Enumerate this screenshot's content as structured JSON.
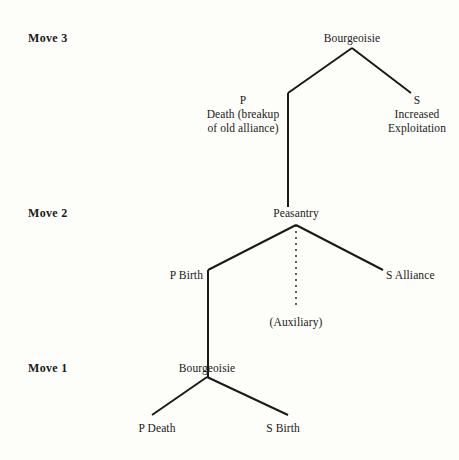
{
  "diagram": {
    "background_color": "#fdfdfa",
    "ink_color": "#1a1a18",
    "move_labels": [
      {
        "id": "move-3",
        "text": "Move 3",
        "x": 28,
        "y": 31
      },
      {
        "id": "move-2",
        "text": "Move 2",
        "x": 28,
        "y": 206
      },
      {
        "id": "move-1",
        "text": "Move 1",
        "x": 28,
        "y": 361
      }
    ],
    "nodes": [
      {
        "id": "move3-root",
        "text": "Bourgeoisie",
        "x": 352,
        "y": 31,
        "align": "center"
      },
      {
        "id": "move3-left-line1",
        "text": "P",
        "x": 243,
        "y": 93,
        "align": "center"
      },
      {
        "id": "move3-left-line2",
        "text": "Death (breakup",
        "x": 243,
        "y": 107,
        "align": "center"
      },
      {
        "id": "move3-left-line3",
        "text": "of old alliance)",
        "x": 243,
        "y": 121,
        "align": "center"
      },
      {
        "id": "move3-right-line1",
        "text": "S",
        "x": 417,
        "y": 93,
        "align": "center"
      },
      {
        "id": "move3-right-line2",
        "text": "Increased",
        "x": 417,
        "y": 107,
        "align": "center"
      },
      {
        "id": "move3-right-line3",
        "text": "Exploitation",
        "x": 417,
        "y": 121,
        "align": "center"
      },
      {
        "id": "move2-root",
        "text": "Peasantry",
        "x": 296,
        "y": 206,
        "align": "center"
      },
      {
        "id": "move2-left",
        "text": "P Birth",
        "x": 203,
        "y": 268,
        "align": "right"
      },
      {
        "id": "move2-right",
        "text": "S Alliance",
        "x": 386,
        "y": 268,
        "align": "left"
      },
      {
        "id": "move2-aux",
        "text": "(Auxiliary)",
        "x": 296,
        "y": 315,
        "align": "center"
      },
      {
        "id": "move1-root",
        "text": "Bourgeoisie",
        "x": 207,
        "y": 361,
        "align": "center"
      },
      {
        "id": "move1-left",
        "text": "P Death",
        "x": 157,
        "y": 421,
        "align": "center"
      },
      {
        "id": "move1-right",
        "text": "S Birth",
        "x": 283,
        "y": 421,
        "align": "center"
      }
    ],
    "edges": [
      {
        "id": "edge-move3-root-to-left",
        "from": "move3-root",
        "to": "move3-left",
        "style": "solid",
        "points": "352,48 288,93"
      },
      {
        "id": "edge-move3-root-to-right",
        "from": "move3-root",
        "to": "move3-right",
        "style": "solid",
        "points": "352,48 411,93"
      },
      {
        "id": "edge-move3-left-to-move2",
        "from": "move3-left",
        "to": "move2-root",
        "style": "solid",
        "points": "288,93 288,207"
      },
      {
        "id": "edge-move2-root-to-left",
        "from": "move2-root",
        "to": "move2-left",
        "style": "solid",
        "points": "296,225 208,270"
      },
      {
        "id": "edge-move2-root-to-right",
        "from": "move2-root",
        "to": "move2-right",
        "style": "solid",
        "points": "296,225 383,270"
      },
      {
        "id": "edge-move2-root-to-aux",
        "from": "move2-root",
        "to": "move2-aux",
        "style": "dashed",
        "points": "296,225 296,305"
      },
      {
        "id": "edge-move2-left-to-move1",
        "from": "move2-left",
        "to": "move1-root",
        "style": "solid",
        "points": "208,270 208,377"
      },
      {
        "id": "edge-move1-root-to-left",
        "from": "move1-root",
        "to": "move1-left",
        "style": "solid",
        "points": "207,377 152,415"
      },
      {
        "id": "edge-move1-root-to-right",
        "from": "move1-root",
        "to": "move1-right",
        "style": "solid",
        "points": "207,377 288,415"
      }
    ]
  }
}
